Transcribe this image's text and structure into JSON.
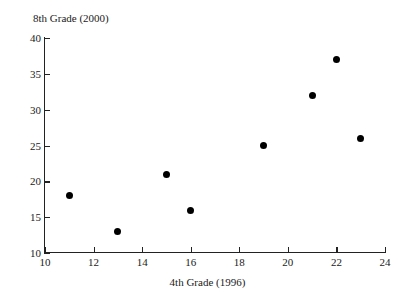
{
  "chart_data": {
    "type": "scatter",
    "title": "",
    "xlabel": "4th Grade (1996)",
    "ylabel": "8th Grade (2000)",
    "xlim": [
      10,
      24
    ],
    "ylim": [
      10,
      40
    ],
    "xticks": [
      10,
      12,
      14,
      16,
      18,
      20,
      22,
      24
    ],
    "yticks": [
      10,
      15,
      20,
      25,
      30,
      35,
      40
    ],
    "grid": false,
    "legend": null,
    "marker": {
      "shape": "filled-circle",
      "color": "#000000",
      "size_px": 7
    },
    "points": [
      {
        "x": 11,
        "y": 18
      },
      {
        "x": 13,
        "y": 13
      },
      {
        "x": 15,
        "y": 21
      },
      {
        "x": 16,
        "y": 16
      },
      {
        "x": 19,
        "y": 25
      },
      {
        "x": 21,
        "y": 32
      },
      {
        "x": 22,
        "y": 37
      },
      {
        "x": 23,
        "y": 26
      }
    ],
    "x": [
      11,
      13,
      15,
      16,
      19,
      21,
      22,
      23
    ],
    "values": [
      18,
      13,
      21,
      16,
      25,
      32,
      37,
      26
    ]
  }
}
